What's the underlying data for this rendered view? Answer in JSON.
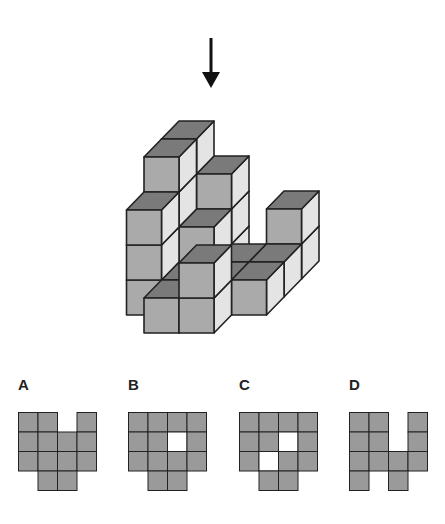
{
  "puzzle": {
    "view_direction": "top-down",
    "arrow_icon": "down-arrow",
    "colors": {
      "top_face": "#7a7a7a",
      "front_face": "#aaaaaa",
      "side_face": "#e4e4e4",
      "edge": "#222222",
      "grid_fill": "#9a9a9a",
      "grid_empty": "#ffffff"
    },
    "cubes_note": "cube positions as [column, depth, level] in unit cubes",
    "cubes": [
      [
        -1,
        1,
        0
      ],
      [
        -1,
        1,
        1
      ],
      [
        -1,
        1,
        2
      ],
      [
        -1,
        2,
        0
      ],
      [
        -1,
        2,
        1
      ],
      [
        -1,
        2,
        2
      ],
      [
        -1,
        2,
        3
      ],
      [
        -1,
        3,
        0
      ],
      [
        -1,
        3,
        1
      ],
      [
        -1,
        3,
        2
      ],
      [
        -1,
        3,
        3
      ],
      [
        0,
        0,
        0
      ],
      [
        1,
        0,
        0
      ],
      [
        1,
        0,
        1
      ],
      [
        0,
        1,
        0
      ],
      [
        0,
        2,
        0
      ],
      [
        0,
        2,
        1
      ],
      [
        0,
        3,
        0
      ],
      [
        0,
        3,
        1
      ],
      [
        0,
        3,
        2
      ],
      [
        1,
        1,
        0
      ],
      [
        1,
        2,
        0
      ],
      [
        2,
        1,
        0
      ],
      [
        2,
        2,
        0
      ],
      [
        2,
        3,
        0
      ],
      [
        2,
        3,
        1
      ]
    ]
  },
  "options": [
    {
      "label": "A",
      "grid": [
        [
          1,
          1,
          0,
          1
        ],
        [
          1,
          1,
          1,
          1
        ],
        [
          1,
          1,
          1,
          1
        ],
        [
          0,
          1,
          1,
          0
        ]
      ]
    },
    {
      "label": "B",
      "grid": [
        [
          1,
          1,
          1,
          1
        ],
        [
          1,
          1,
          2,
          1
        ],
        [
          1,
          1,
          1,
          1
        ],
        [
          0,
          1,
          1,
          0
        ]
      ]
    },
    {
      "label": "C",
      "grid": [
        [
          1,
          1,
          1,
          1
        ],
        [
          1,
          1,
          2,
          1
        ],
        [
          1,
          2,
          1,
          1
        ],
        [
          0,
          1,
          1,
          0
        ]
      ]
    },
    {
      "label": "D",
      "grid": [
        [
          1,
          1,
          0,
          1
        ],
        [
          1,
          1,
          0,
          1
        ],
        [
          1,
          1,
          1,
          1
        ],
        [
          1,
          0,
          1,
          0
        ]
      ]
    }
  ]
}
